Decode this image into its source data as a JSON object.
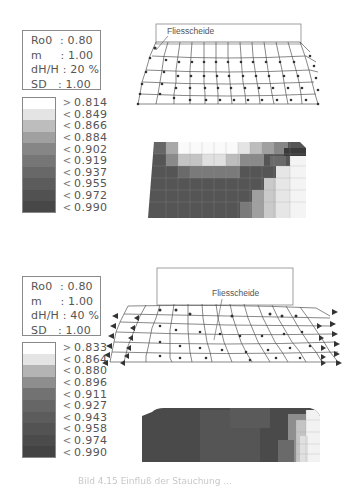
{
  "figure": {
    "domain_note": "FEM simulation figure, two stages of upsetting",
    "colors": {
      "ink": "#444444",
      "frame": "#888888",
      "grayscale_levels": [
        "#ffffff",
        "#e6e6e6",
        "#c4c4c4",
        "#a8a8a8",
        "#8c8c8c",
        "#7a7a7a",
        "#6a6a6a",
        "#5c5c5c",
        "#505050",
        "#454545"
      ]
    },
    "panels": [
      {
        "id": "top",
        "params": [
          {
            "key": "Ro0",
            "sep": " :",
            "value": "0.80"
          },
          {
            "key": "m",
            "sep": " :",
            "value": "1.00"
          },
          {
            "key": "dH/H",
            "sep": ":",
            "value": "20 %"
          },
          {
            "key": "SD",
            "sep": " :",
            "value": "1.00"
          }
        ],
        "legend": [
          {
            "op": ">",
            "value": "0.814"
          },
          {
            "op": "<",
            "value": "0.849"
          },
          {
            "op": "<",
            "value": "0.866"
          },
          {
            "op": "<",
            "value": "0.884"
          },
          {
            "op": "<",
            "value": "0.902"
          },
          {
            "op": "<",
            "value": "0.919"
          },
          {
            "op": "<",
            "value": "0.937"
          },
          {
            "op": "<",
            "value": "0.955"
          },
          {
            "op": "<",
            "value": "0.972"
          },
          {
            "op": "<",
            "value": "0.990"
          }
        ],
        "mesh_label": "Fliesscheide"
      },
      {
        "id": "bottom",
        "params": [
          {
            "key": "Ro0",
            "sep": " :",
            "value": "0.80"
          },
          {
            "key": "m",
            "sep": " :",
            "value": "1.00"
          },
          {
            "key": "dH/H",
            "sep": ":",
            "value": "40 %"
          },
          {
            "key": "SD",
            "sep": " :",
            "value": "1.00"
          }
        ],
        "legend": [
          {
            "op": ">",
            "value": "0.833"
          },
          {
            "op": "<",
            "value": "0.864"
          },
          {
            "op": "<",
            "value": "0.880"
          },
          {
            "op": "<",
            "value": "0.896"
          },
          {
            "op": "<",
            "value": "0.911"
          },
          {
            "op": "<",
            "value": "0.927"
          },
          {
            "op": "<",
            "value": "0.943"
          },
          {
            "op": "<",
            "value": "0.958"
          },
          {
            "op": "<",
            "value": "0.974"
          },
          {
            "op": "<",
            "value": "0.990"
          }
        ],
        "mesh_label": "Fliesscheide"
      }
    ],
    "caption": "Bild 4.15 Einfluß der Stauchung ..."
  }
}
